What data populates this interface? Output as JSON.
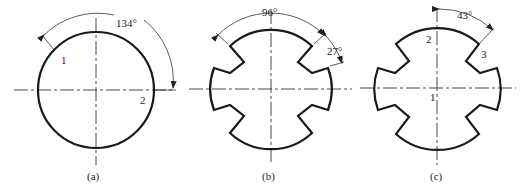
{
  "figures": [
    {
      "id": "a",
      "caption": "(a)",
      "angle_label": "134°",
      "point_labels": [
        "1",
        "2"
      ],
      "shape": "circle"
    },
    {
      "id": "b",
      "caption": "(b)",
      "angle_label_top": "96°",
      "angle_label_side": "27°",
      "shape": "notched-disc-4-slots"
    },
    {
      "id": "c",
      "caption": "(c)",
      "angle_label": "43°",
      "point_labels": [
        "1",
        "2",
        "3"
      ],
      "shape": "notched-disc-4-slots"
    }
  ]
}
